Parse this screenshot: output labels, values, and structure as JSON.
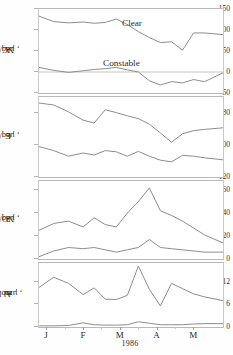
{
  "figure": {
    "xlabel": "1986",
    "months": [
      "J",
      "F",
      "M",
      "A",
      "M"
    ],
    "series_labels": {
      "clear": "Clear",
      "constable": "Constable"
    }
  },
  "chart_data": [
    {
      "type": "line",
      "panel": 1,
      "ylabel": "ANC, µeq/l",
      "ylabel_main": "A",
      "ylabel_sub": "NC",
      "ylabel_unit": ", µeq/l",
      "xlabel": "1986",
      "ylim": [
        -50,
        150
      ],
      "yticks": [
        150,
        100,
        50,
        0,
        -50
      ],
      "ytick_labels": [
        "150",
        "100",
        "50",
        "0",
        "-50"
      ],
      "grid": false,
      "legend": "inline-annotations",
      "x": [
        0,
        0.08,
        0.16,
        0.24,
        0.3,
        0.36,
        0.42,
        0.48,
        0.54,
        0.6,
        0.66,
        0.72,
        0.78,
        0.84,
        0.9,
        1.0
      ],
      "series": [
        {
          "name": "Clear",
          "values": [
            133,
            120,
            117,
            119,
            116,
            118,
            126,
            113,
            96,
            82,
            70,
            72,
            52,
            93,
            93,
            89
          ]
        },
        {
          "name": "Constable",
          "values": [
            11,
            4,
            -1,
            3,
            6,
            8,
            11,
            5,
            0,
            -21,
            -31,
            -23,
            -26,
            -18,
            -23,
            -2
          ]
        }
      ]
    },
    {
      "type": "line",
      "panel": 2,
      "ylabel": "Cb, µeq/l",
      "ylabel_main": "C",
      "ylabel_sub": "b",
      "ylabel_unit": ", µeq/l",
      "xlabel": "1986",
      "ylim": [
        120,
        320
      ],
      "yticks": [
        280,
        200,
        120
      ],
      "ytick_labels": [
        "280",
        "200",
        "120"
      ],
      "grid": false,
      "x": [
        0,
        0.08,
        0.16,
        0.24,
        0.3,
        0.36,
        0.42,
        0.48,
        0.54,
        0.6,
        0.66,
        0.72,
        0.78,
        0.84,
        0.9,
        1.0
      ],
      "series": [
        {
          "name": "Clear",
          "values": [
            305,
            300,
            283,
            262,
            255,
            288,
            281,
            273,
            266,
            252,
            230,
            207,
            228,
            236,
            239,
            243
          ]
        },
        {
          "name": "Constable",
          "values": [
            196,
            186,
            172,
            180,
            175,
            186,
            183,
            172,
            184,
            172,
            162,
            158,
            174,
            172,
            168,
            163
          ]
        }
      ]
    },
    {
      "type": "line",
      "panel": 3,
      "ylabel": "NO3-, µeq/l",
      "ylabel_main": "NO",
      "ylabel_sub": "3",
      "ylabel_sup": "-",
      "ylabel_unit": ", µeq/l",
      "xlabel": "1986",
      "ylim": [
        0,
        68
      ],
      "yticks": [
        60,
        40,
        20,
        0
      ],
      "ytick_labels": [
        "60",
        "40",
        "20",
        "0"
      ],
      "grid": false,
      "x": [
        0,
        0.08,
        0.16,
        0.24,
        0.3,
        0.36,
        0.42,
        0.48,
        0.54,
        0.6,
        0.66,
        0.72,
        0.78,
        0.84,
        0.9,
        1.0
      ],
      "series": [
        {
          "name": "Clear",
          "values": [
            25,
            31,
            33,
            28,
            36,
            30,
            28,
            40,
            50,
            62,
            42,
            38,
            33,
            27,
            21,
            14
          ]
        },
        {
          "name": "Constable",
          "values": [
            2,
            7,
            10,
            9,
            10,
            8,
            6,
            8,
            10,
            17,
            10,
            9,
            8,
            7,
            6,
            6
          ]
        }
      ]
    },
    {
      "type": "line",
      "panel": 4,
      "ylabel": "Alm, µmol/l",
      "ylabel_main": "Al",
      "ylabel_sub": "m",
      "ylabel_unit": ", µmol/l",
      "xlabel": "1986",
      "ylim": [
        0,
        17
      ],
      "yticks": [
        12,
        6,
        0
      ],
      "ytick_labels": [
        "12",
        "6",
        "0"
      ],
      "grid": false,
      "x": [
        0,
        0.08,
        0.16,
        0.24,
        0.3,
        0.36,
        0.42,
        0.48,
        0.54,
        0.6,
        0.66,
        0.72,
        0.78,
        0.84,
        0.9,
        1.0
      ],
      "series": [
        {
          "name": "Constable",
          "values": [
            10.5,
            13.2,
            11.6,
            8.6,
            10.4,
            7.4,
            7.3,
            8.4,
            16.2,
            10.0,
            5.6,
            11.6,
            10.2,
            8.8,
            8.0,
            7.0
          ]
        },
        {
          "name": "Clear",
          "values": [
            0.3,
            0.3,
            0.4,
            1.1,
            0.6,
            0.5,
            0.5,
            0.6,
            1.4,
            1.0,
            0.6,
            0.6,
            0.6,
            0.8,
            0.9,
            0.9
          ]
        }
      ]
    }
  ]
}
